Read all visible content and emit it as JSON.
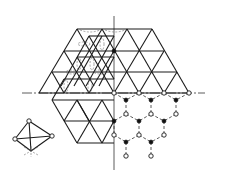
{
  "diagram": {
    "colors": {
      "line": "#1a1a1a",
      "background": "#ffffff"
    },
    "axes": {
      "vertical": {
        "x": 114,
        "y1": 16,
        "y2": 170
      },
      "horizontal": {
        "y": 93,
        "x1": 22,
        "x2": 205
      }
    },
    "legend_symbols": {
      "open_circle": "open-atom-site",
      "filled_circle": "filled-atom-site"
    },
    "honeycomb": {
      "open_sites": [
        [
          114,
          93
        ],
        [
          139,
          93
        ],
        [
          164,
          93
        ],
        [
          189,
          93
        ],
        [
          126,
          114
        ],
        [
          151,
          114
        ],
        [
          176,
          114
        ],
        [
          114,
          135
        ],
        [
          139,
          135
        ],
        [
          164,
          135
        ],
        [
          126,
          156
        ],
        [
          151,
          156
        ]
      ],
      "filled_sites": [
        [
          114,
          51
        ],
        [
          126,
          100
        ],
        [
          151,
          100
        ],
        [
          176,
          100
        ],
        [
          114,
          121
        ],
        [
          139,
          121
        ],
        [
          164,
          121
        ],
        [
          126,
          142
        ],
        [
          151,
          142
        ]
      ]
    },
    "inset": {
      "type": "tetrahedron",
      "vertices_open": [
        [
          29,
          121
        ],
        [
          15,
          139
        ],
        [
          52,
          136
        ]
      ],
      "apex": [
        31,
        152
      ]
    }
  }
}
